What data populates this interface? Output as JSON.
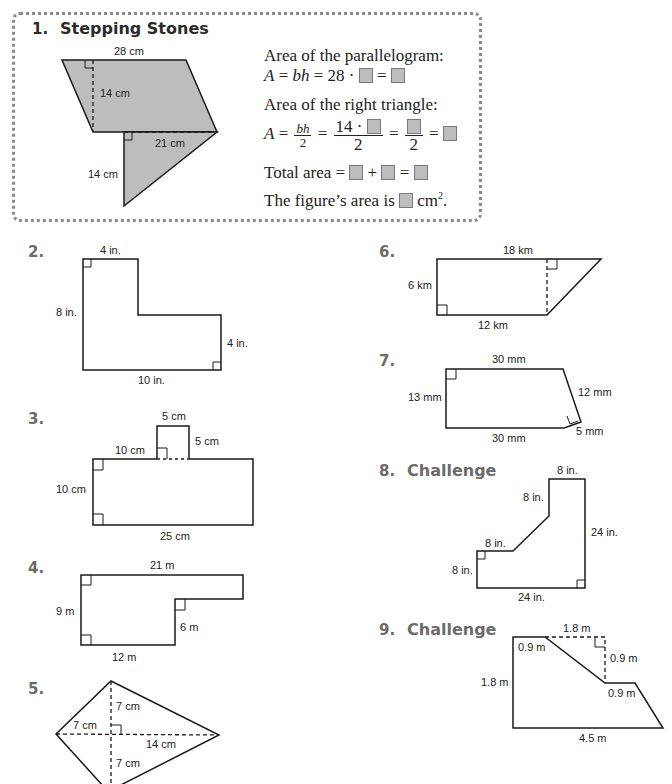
{
  "problems": [
    {
      "number": "1.",
      "title": "Stepping Stones",
      "labels": {
        "top": "28 cm",
        "height": "14 cm",
        "triangle_base": "21 cm",
        "triangle_height": "14 cm"
      },
      "work": {
        "line1": "Area of the parallelogram:",
        "line2_prefix": "A = bh = 28 ·",
        "line3": "Area of the right triangle:",
        "line4_num1": "bh",
        "line4_den": "2",
        "line4_num2": "14 ·",
        "total_label": "Total area =",
        "final_prefix": "The figure’s area is",
        "final_unit": "cm",
        "final_exp": "2",
        "final_end": "."
      }
    },
    {
      "number": "2.",
      "labels": {
        "top": "4 in.",
        "left": "8 in.",
        "right": "4 in.",
        "bottom": "10 in."
      }
    },
    {
      "number": "3.",
      "labels": {
        "tab_top": "5 cm",
        "tab_side": "5 cm",
        "top_left": "10 cm",
        "left": "10 cm",
        "bottom": "25 cm"
      }
    },
    {
      "number": "4.",
      "labels": {
        "top": "21 m",
        "left": "9 m",
        "inner": "6 m",
        "bottom": "12 m"
      }
    },
    {
      "number": "5.",
      "labels": {
        "upper": "7 cm",
        "left": "7 cm",
        "right": "14 cm",
        "lower": "7 cm"
      }
    },
    {
      "number": "6.",
      "labels": {
        "top": "18 km",
        "left": "6 km",
        "bottom": "12 km"
      }
    },
    {
      "number": "7.",
      "labels": {
        "top": "30 mm",
        "left": "13 mm",
        "slant": "12 mm",
        "small": "5 mm",
        "bottom": "30 mm"
      }
    },
    {
      "number": "8.",
      "title": "Challenge",
      "labels": {
        "top": "8 in.",
        "upper_left": "8 in.",
        "right": "24 in.",
        "step": "8 in.",
        "left": "8 in.",
        "bottom": "24 in."
      }
    },
    {
      "number": "9.",
      "title": "Challenge",
      "labels": {
        "top": "1.8 m",
        "top_left": "0.9 m",
        "drop": "0.9 m",
        "left": "1.8 m",
        "ledge": "0.9 m",
        "bottom": "4.5 m"
      }
    }
  ],
  "colors": {
    "shape_fill": "#bdbdbd",
    "stroke": "#1a1a1a",
    "number_gray": "#6b6b6b",
    "box_border": "#8a8a8a"
  }
}
